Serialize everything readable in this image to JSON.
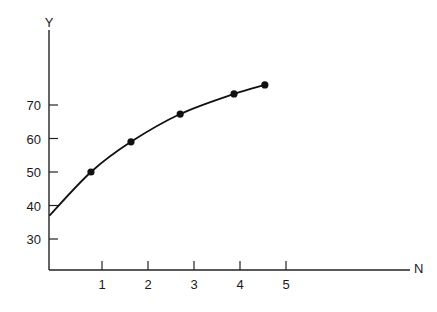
{
  "chart_data": {
    "type": "line",
    "title": "",
    "xlabel": "N",
    "ylabel": "Y",
    "x_ticks": [
      1,
      2,
      3,
      4,
      5
    ],
    "y_ticks": [
      30,
      40,
      50,
      60,
      70
    ],
    "xlim": [
      -0.15,
      7.75
    ],
    "ylim": [
      20.7,
      95
    ],
    "grid": false,
    "legend": null,
    "series": [
      {
        "name": "Y vs N",
        "markers": true,
        "points": [
          {
            "x": 0.76,
            "y": 50.0
          },
          {
            "x": 1.63,
            "y": 59.0
          },
          {
            "x": 2.7,
            "y": 67.3
          },
          {
            "x": 3.87,
            "y": 73.3
          },
          {
            "x": 4.54,
            "y": 76.0
          }
        ],
        "curve_start": {
          "x": -0.15,
          "y": 37.0
        }
      }
    ]
  },
  "style": {
    "line_color": "#111111",
    "axis_color": "#222222",
    "background": "#ffffff"
  }
}
